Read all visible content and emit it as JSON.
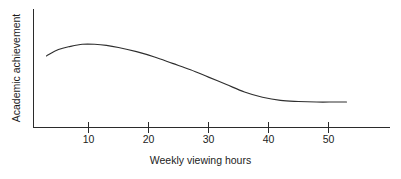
{
  "chart_data": {
    "type": "line",
    "title": "",
    "subtitle": "",
    "xlabel": "Weekly viewing hours",
    "ylabel": "Academic achievement",
    "xlim": [
      0,
      60
    ],
    "ylim": [
      0,
      1
    ],
    "grid": false,
    "legend": null,
    "xticks": [
      10,
      20,
      30,
      40,
      50
    ],
    "xtick_labels": [
      "10",
      "20",
      "30",
      "40",
      "50"
    ],
    "yticks": [],
    "ytick_labels": [],
    "annotations": [],
    "series": [
      {
        "name": "Academic achievement vs weekly viewing hours",
        "color": "#2f2f2f",
        "x": [
          3,
          5,
          7,
          9,
          11,
          13,
          15,
          18,
          21,
          24,
          27,
          30,
          33,
          36,
          39,
          42,
          45,
          48,
          51,
          53
        ],
        "y": [
          0.68,
          0.74,
          0.77,
          0.79,
          0.79,
          0.78,
          0.76,
          0.72,
          0.67,
          0.61,
          0.55,
          0.48,
          0.41,
          0.34,
          0.29,
          0.26,
          0.25,
          0.245,
          0.245,
          0.245
        ]
      }
    ]
  },
  "axes": {
    "x_axis_label": "Weekly viewing hours",
    "y_axis_label": "Academic achievement",
    "tick_10": "10",
    "tick_20": "20",
    "tick_30": "30",
    "tick_40": "40",
    "tick_50": "50"
  },
  "colors": {
    "curve": "#2f2f2f",
    "axis": "#2b2b2b",
    "text": "#1c1c1c",
    "background": "#ffffff"
  }
}
